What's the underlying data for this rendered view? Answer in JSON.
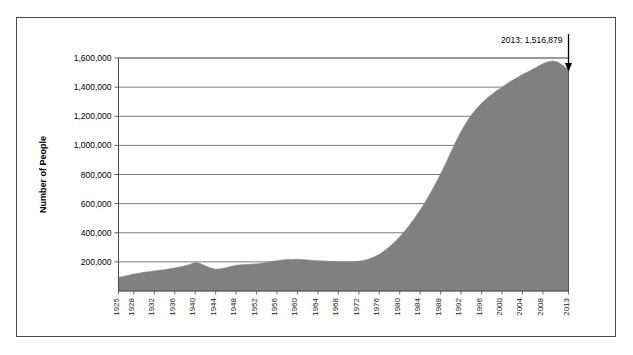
{
  "chart_data": {
    "type": "area",
    "title": "",
    "xlabel": "",
    "ylabel": "Number of People",
    "ylim": [
      0,
      1600000
    ],
    "xlim": [
      1925,
      2013
    ],
    "grid": true,
    "legend": "none",
    "series_color": "#808080",
    "axis_color": "#4a4a4a",
    "gridline_color": "#6e6e6e",
    "ytick_labels": [
      "200,000",
      "400,000",
      "600,000",
      "800,000",
      "1,000,000",
      "1,200,000",
      "1,400,000",
      "1,600,000"
    ],
    "ytick_values": [
      200000,
      400000,
      600000,
      800000,
      1000000,
      1200000,
      1400000,
      1600000
    ],
    "xtick_labels": [
      "1925",
      "1928",
      "1932",
      "1936",
      "1940",
      "1944",
      "1948",
      "1952",
      "1956",
      "1960",
      "1964",
      "1968",
      "1972",
      "1976",
      "1980",
      "1984",
      "1988",
      "1992",
      "1996",
      "2000",
      "2004",
      "2008",
      "2013"
    ],
    "annotation": {
      "label": "2013: 1,516,879",
      "year": 2013,
      "value": 1516879,
      "arrow": "down-arrow"
    },
    "x": [
      1925,
      1926,
      1927,
      1928,
      1929,
      1930,
      1931,
      1932,
      1933,
      1934,
      1935,
      1936,
      1937,
      1938,
      1939,
      1940,
      1941,
      1942,
      1943,
      1944,
      1945,
      1946,
      1947,
      1948,
      1949,
      1950,
      1951,
      1952,
      1953,
      1954,
      1955,
      1956,
      1957,
      1958,
      1959,
      1960,
      1961,
      1962,
      1963,
      1964,
      1965,
      1966,
      1967,
      1968,
      1969,
      1970,
      1971,
      1972,
      1973,
      1974,
      1975,
      1976,
      1977,
      1978,
      1979,
      1980,
      1981,
      1982,
      1983,
      1984,
      1985,
      1986,
      1987,
      1988,
      1989,
      1990,
      1991,
      1992,
      1993,
      1994,
      1995,
      1996,
      1997,
      1998,
      1999,
      2000,
      2001,
      2002,
      2003,
      2004,
      2005,
      2006,
      2007,
      2008,
      2009,
      2010,
      2011,
      2012,
      2013
    ],
    "values": [
      92000,
      100000,
      108000,
      116000,
      122000,
      128000,
      133000,
      138000,
      142000,
      146000,
      152000,
      158000,
      165000,
      173000,
      182000,
      195000,
      188000,
      172000,
      158000,
      150000,
      152000,
      160000,
      168000,
      176000,
      180000,
      182000,
      184000,
      186000,
      190000,
      196000,
      202000,
      208000,
      213000,
      216000,
      217000,
      218000,
      216000,
      213000,
      210000,
      208000,
      206000,
      204000,
      202000,
      200000,
      199000,
      199000,
      201000,
      204000,
      210000,
      220000,
      234000,
      252000,
      276000,
      304000,
      336000,
      372000,
      412000,
      456000,
      504000,
      556000,
      612000,
      672000,
      736000,
      804000,
      876000,
      952000,
      1028000,
      1096000,
      1156000,
      1208000,
      1252000,
      1290000,
      1322000,
      1350000,
      1376000,
      1400000,
      1424000,
      1446000,
      1466000,
      1486000,
      1504000,
      1522000,
      1542000,
      1560000,
      1574000,
      1580000,
      1570000,
      1546000,
      1516879
    ]
  }
}
